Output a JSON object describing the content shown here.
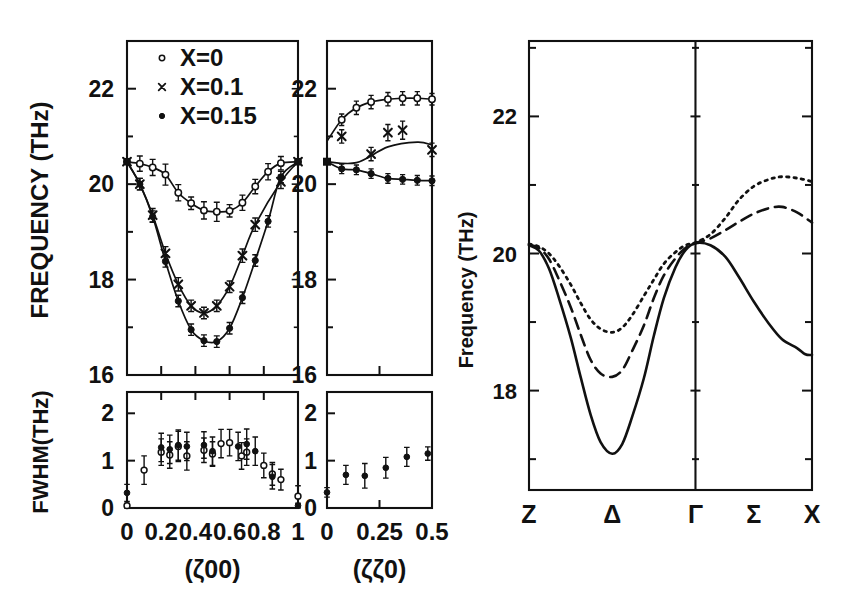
{
  "figure": {
    "title": "",
    "background": "#ffffff",
    "ink": "#111111"
  },
  "panels": {
    "left_freq_00": {
      "name": "(z00) phonon frequency panel",
      "ylabel": "FREQUENCY (THz)",
      "xlabel": "(ζ00)",
      "yticks": [
        16,
        17,
        18,
        19,
        20,
        21,
        22,
        23
      ],
      "ytick_labels": [
        "16",
        "",
        "18",
        "",
        "20",
        "",
        "22",
        ""
      ],
      "ylim": [
        16,
        23
      ],
      "xlim": [
        0,
        1
      ],
      "xticks": [
        0,
        0.2,
        0.4,
        0.6,
        0.8,
        1
      ],
      "xtick_labels": [
        "0",
        "0.2",
        "0.4",
        "0.6",
        "0.8",
        "1"
      ]
    },
    "left_freq_z0": {
      "name": "(zz0) phonon frequency panel",
      "xlabel": "(ζζ0)",
      "yticks": [
        16,
        17,
        18,
        19,
        20,
        21,
        22,
        23
      ],
      "ytick_labels": [
        "16",
        "",
        "18",
        "",
        "20",
        "",
        "22",
        ""
      ],
      "ylim": [
        16,
        23
      ],
      "xlim": [
        0,
        0.5
      ],
      "xticks": [
        0,
        0.25,
        0.5
      ],
      "xtick_labels": [
        "0",
        "0.25",
        "0.5"
      ]
    },
    "fwhm_00": {
      "name": "(z00) FWHM panel",
      "ylabel": "FWHM(THz)",
      "xlabel": "(ζ00)",
      "yticks": [
        0,
        1,
        2
      ],
      "ytick_labels": [
        "0",
        "1",
        "2"
      ],
      "ylim": [
        0,
        2.45
      ],
      "xlim": [
        0,
        1
      ]
    },
    "fwhm_z0": {
      "name": "(zz0) FWHM panel",
      "xlabel": "(ζζ0)",
      "yticks": [
        0,
        1,
        2
      ],
      "ytick_labels": [
        "0",
        "1",
        "2"
      ],
      "ylim": [
        0,
        2.45
      ],
      "xlim": [
        0,
        0.5
      ]
    },
    "dispersion": {
      "name": "calculated dispersion panel",
      "ylabel": "Frequency (THz)",
      "yticks": [
        17,
        18,
        19,
        20,
        21,
        22,
        23
      ],
      "ytick_labels": [
        "",
        "18",
        "",
        "20",
        "",
        "22",
        ""
      ],
      "ylim": [
        16.55,
        23.1
      ],
      "xtick_labels": [
        "Z",
        "Δ",
        "Γ",
        "Σ",
        "X"
      ],
      "xtick_positions": [
        0,
        0.5,
        1.0,
        1.35,
        1.7
      ]
    }
  },
  "legend": {
    "items": [
      {
        "marker": "open-circle",
        "label": "X=0"
      },
      {
        "marker": "cross",
        "label": "X=0.1"
      },
      {
        "marker": "filled-circle",
        "label": "X=0.15"
      }
    ]
  },
  "chart_data": [
    {
      "type": "scatter",
      "id": "freq-zeta00",
      "title": "",
      "xlabel": "(ζ00)",
      "ylabel": "FREQUENCY (THz)",
      "xlim": [
        0,
        1
      ],
      "ylim": [
        16,
        23
      ],
      "grid": false,
      "legend_position": "top-left",
      "series": [
        {
          "name": "X=0",
          "marker": "open-circle",
          "x": [
            0.0,
            0.075,
            0.15,
            0.225,
            0.3,
            0.375,
            0.45,
            0.525,
            0.6,
            0.675,
            0.75,
            0.825,
            0.9,
            1.0
          ],
          "y": [
            20.47,
            20.43,
            20.35,
            20.2,
            19.82,
            19.6,
            19.45,
            19.42,
            19.44,
            19.61,
            19.95,
            20.26,
            20.44,
            20.47
          ],
          "yerr": [
            0.0,
            0.16,
            0.17,
            0.22,
            0.17,
            0.13,
            0.18,
            0.2,
            0.13,
            0.16,
            0.15,
            0.17,
            0.14,
            0.0
          ]
        },
        {
          "name": "X=0.1",
          "marker": "cross",
          "x": [
            0.0,
            0.075,
            0.15,
            0.225,
            0.3,
            0.375,
            0.45,
            0.525,
            0.6,
            0.675,
            0.75,
            0.9,
            1.0
          ],
          "y": [
            20.47,
            20.0,
            19.35,
            18.55,
            17.9,
            17.45,
            17.3,
            17.45,
            17.85,
            18.5,
            19.15,
            20.05,
            20.47
          ],
          "yerr": [
            0.0,
            0.12,
            0.14,
            0.14,
            0.14,
            0.12,
            0.12,
            0.12,
            0.12,
            0.14,
            0.14,
            0.14,
            0.0
          ]
        },
        {
          "name": "X=0.15",
          "marker": "filled-circle",
          "x": [
            0.0,
            0.075,
            0.15,
            0.225,
            0.3,
            0.375,
            0.45,
            0.525,
            0.6,
            0.675,
            0.75,
            0.825,
            0.9,
            1.0
          ],
          "y": [
            20.47,
            20.0,
            19.32,
            18.38,
            17.55,
            16.95,
            16.72,
            16.7,
            16.98,
            17.62,
            18.4,
            19.22,
            20.15,
            20.47
          ],
          "yerr": [
            0.0,
            0.12,
            0.12,
            0.12,
            0.12,
            0.12,
            0.12,
            0.12,
            0.12,
            0.12,
            0.12,
            0.12,
            0.12,
            0.0
          ]
        }
      ],
      "fit_curves": [
        {
          "for": "X=0",
          "style": "solid"
        },
        {
          "for": "X=0.1",
          "style": "solid"
        },
        {
          "for": "X=0.15",
          "style": "solid"
        }
      ]
    },
    {
      "type": "scatter",
      "id": "freq-zetazeta0",
      "title": "",
      "xlabel": "(ζζ0)",
      "ylabel": "",
      "xlim": [
        0,
        0.5
      ],
      "ylim": [
        16,
        23
      ],
      "grid": false,
      "series": [
        {
          "name": "X=0",
          "marker": "open-circle",
          "x": [
            0.07,
            0.14,
            0.21,
            0.29,
            0.36,
            0.43,
            0.5
          ],
          "y": [
            21.35,
            21.6,
            21.72,
            21.78,
            21.8,
            21.8,
            21.78
          ],
          "yerr": [
            0.12,
            0.14,
            0.14,
            0.14,
            0.14,
            0.14,
            0.12
          ]
        },
        {
          "name": "X=0.1",
          "marker": "cross",
          "x": [
            0.07,
            0.21,
            0.29,
            0.36,
            0.5
          ],
          "y": [
            21.0,
            20.63,
            21.08,
            21.13,
            20.72
          ],
          "yerr": [
            0.14,
            0.14,
            0.17,
            0.19,
            0.14
          ]
        },
        {
          "name": "X=0.15",
          "marker": "filled-circle",
          "x": [
            0.0,
            0.07,
            0.14,
            0.21,
            0.29,
            0.36,
            0.43,
            0.5
          ],
          "y": [
            20.47,
            20.32,
            20.3,
            20.22,
            20.12,
            20.1,
            20.08,
            20.07
          ],
          "yerr": [
            0.0,
            0.1,
            0.1,
            0.1,
            0.1,
            0.1,
            0.1,
            0.1
          ]
        }
      ],
      "fit_curves": [
        {
          "for": "X=0",
          "style": "solid"
        },
        {
          "for": "X=0.1",
          "style": "solid"
        },
        {
          "for": "X=0.15",
          "style": "solid"
        }
      ]
    },
    {
      "type": "scatter",
      "id": "fwhm-zeta00",
      "title": "",
      "xlabel": "(ζ00)",
      "ylabel": "FWHM(THz)",
      "xlim": [
        0,
        1
      ],
      "ylim": [
        0,
        2.45
      ],
      "grid": false,
      "series": [
        {
          "name": "X=0",
          "marker": "open-circle",
          "x": [
            0.0,
            0.1,
            0.2,
            0.25,
            0.3,
            0.35,
            0.45,
            0.5,
            0.55,
            0.6,
            0.67,
            0.7,
            0.8,
            0.85,
            0.9,
            1.0
          ],
          "y": [
            0.05,
            0.8,
            1.18,
            1.12,
            1.3,
            1.1,
            1.22,
            1.14,
            1.36,
            1.38,
            1.1,
            1.18,
            0.9,
            0.72,
            0.6,
            0.25
          ],
          "yerr": [
            0.05,
            0.3,
            0.28,
            0.28,
            0.32,
            0.3,
            0.26,
            0.26,
            0.3,
            0.28,
            0.28,
            0.28,
            0.26,
            0.24,
            0.22,
            0.22
          ]
        },
        {
          "name": "X=0.15",
          "marker": "filled-circle",
          "x": [
            0.0,
            0.2,
            0.25,
            0.3,
            0.35,
            0.45,
            0.5,
            0.65,
            0.7,
            0.75,
            0.85,
            1.0
          ],
          "y": [
            0.32,
            1.28,
            1.24,
            1.33,
            1.3,
            1.33,
            1.2,
            1.3,
            1.35,
            1.2,
            0.66,
            0.05
          ],
          "yerr": [
            0.18,
            0.3,
            0.3,
            0.32,
            0.3,
            0.28,
            0.3,
            0.3,
            0.32,
            0.3,
            0.26,
            0.05
          ]
        }
      ]
    },
    {
      "type": "scatter",
      "id": "fwhm-zetazeta0",
      "title": "",
      "xlabel": "(ζζ0)",
      "ylabel": "",
      "xlim": [
        0,
        0.5
      ],
      "ylim": [
        0,
        2.45
      ],
      "grid": false,
      "series": [
        {
          "name": "X=0.15",
          "marker": "filled-circle",
          "x": [
            0.0,
            0.09,
            0.18,
            0.28,
            0.38,
            0.48
          ],
          "y": [
            0.33,
            0.7,
            0.68,
            0.85,
            1.08,
            1.15
          ],
          "yerr": [
            0.1,
            0.2,
            0.26,
            0.22,
            0.2,
            0.14
          ]
        }
      ]
    },
    {
      "type": "line",
      "id": "dispersion",
      "title": "",
      "xlabel": "",
      "ylabel": "Frequency (THz)",
      "ylim": [
        16.55,
        23.1
      ],
      "xtick_labels": [
        "Z",
        "Δ",
        "Γ",
        "Σ",
        "X"
      ],
      "grid": false,
      "series": [
        {
          "name": "solid",
          "style": "solid",
          "t": [
            0.0,
            0.06,
            0.12,
            0.18,
            0.25,
            0.31,
            0.37,
            0.43,
            0.5,
            0.56,
            0.62,
            0.69,
            0.75,
            0.81,
            0.88,
            0.94,
            1.0,
            1.09,
            1.18,
            1.26,
            1.35,
            1.44,
            1.52,
            1.61,
            1.66,
            1.7
          ],
          "y": [
            20.12,
            20.04,
            19.78,
            19.35,
            18.78,
            18.2,
            17.65,
            17.25,
            17.08,
            17.22,
            17.62,
            18.18,
            18.8,
            19.35,
            19.8,
            20.05,
            20.15,
            20.12,
            19.95,
            19.66,
            19.3,
            18.98,
            18.75,
            18.62,
            18.53,
            18.52
          ]
        },
        {
          "name": "dashed",
          "style": "dashed",
          "t": [
            0.0,
            0.06,
            0.12,
            0.18,
            0.25,
            0.31,
            0.37,
            0.43,
            0.5,
            0.56,
            0.62,
            0.69,
            0.75,
            0.81,
            0.88,
            0.94,
            1.0,
            1.09,
            1.18,
            1.26,
            1.35,
            1.44,
            1.52,
            1.61,
            1.7
          ],
          "y": [
            20.13,
            20.08,
            19.92,
            19.62,
            19.22,
            18.82,
            18.45,
            18.25,
            18.2,
            18.3,
            18.58,
            18.95,
            19.35,
            19.68,
            19.93,
            20.08,
            20.15,
            20.22,
            20.34,
            20.46,
            20.58,
            20.66,
            20.68,
            20.6,
            20.45
          ]
        },
        {
          "name": "dotted",
          "style": "dotted",
          "t": [
            0.0,
            0.06,
            0.12,
            0.18,
            0.25,
            0.31,
            0.37,
            0.43,
            0.5,
            0.56,
            0.62,
            0.69,
            0.75,
            0.81,
            0.88,
            0.94,
            1.0,
            1.09,
            1.18,
            1.26,
            1.35,
            1.44,
            1.52,
            1.61,
            1.7
          ],
          "y": [
            20.14,
            20.1,
            20.0,
            19.82,
            19.55,
            19.28,
            19.04,
            18.9,
            18.85,
            18.92,
            19.1,
            19.38,
            19.62,
            19.85,
            20.02,
            20.12,
            20.16,
            20.28,
            20.52,
            20.78,
            20.98,
            21.08,
            21.12,
            21.1,
            21.05
          ]
        }
      ]
    }
  ]
}
